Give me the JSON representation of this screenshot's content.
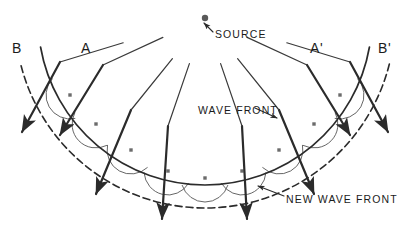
{
  "figure": {
    "ink_color": "#2b2b2b",
    "background_color": "#ffffff",
    "width": 409,
    "height": 228
  },
  "labels": {
    "source": "SOURCE",
    "ray_a_left": "A",
    "ray_b_left": "B",
    "ray_a_right": "A'",
    "ray_b_right": "B'",
    "wave_front": "WAVE FRONT",
    "new_wave_front": "NEW WAVE FRONT"
  },
  "source_point": {
    "x": 205,
    "y": 18,
    "radius": 3.2
  },
  "wave_front": {
    "kind": "solid-arc",
    "description": "original circular wave front centered on the source",
    "center": {
      "x": 205,
      "y": 18
    },
    "radius": 167,
    "start_angle_deg": 10,
    "end_angle_deg": 170
  },
  "new_wave_front": {
    "kind": "dashed-arc",
    "description": "envelope of the secondary wavelets",
    "center": {
      "x": 205,
      "y": 18
    },
    "radius": 190,
    "start_angle_deg": 14,
    "end_angle_deg": 166
  },
  "wavelet_points": [
    {
      "x": 70,
      "y": 95
    },
    {
      "x": 96,
      "y": 124
    },
    {
      "x": 131,
      "y": 150
    },
    {
      "x": 168,
      "y": 171
    },
    {
      "x": 205,
      "y": 178
    },
    {
      "x": 242,
      "y": 171
    },
    {
      "x": 279,
      "y": 150
    },
    {
      "x": 314,
      "y": 124
    },
    {
      "x": 340,
      "y": 95
    }
  ],
  "wavelet_radius": 24,
  "rays": [
    {
      "name": "ray-b-left",
      "label": "B",
      "label_x": 12,
      "label_y": 40,
      "from": {
        "x": 60,
        "y": 62
      },
      "to": {
        "x": 22,
        "y": 132
      }
    },
    {
      "name": "ray-a-left",
      "label": "A",
      "label_x": 81,
      "label_y": 40,
      "from": {
        "x": 103,
        "y": 65
      },
      "to": {
        "x": 60,
        "y": 135
      }
    },
    {
      "name": "ray-mid-left",
      "label": "",
      "from": {
        "x": 131,
        "y": 110
      },
      "to": {
        "x": 96,
        "y": 194
      }
    },
    {
      "name": "ray-inner-left",
      "label": "",
      "from": {
        "x": 168,
        "y": 126
      },
      "to": {
        "x": 162,
        "y": 219
      }
    },
    {
      "name": "ray-inner-right",
      "label": "",
      "from": {
        "x": 242,
        "y": 126
      },
      "to": {
        "x": 247,
        "y": 219
      }
    },
    {
      "name": "ray-mid-right",
      "label": "",
      "from": {
        "x": 279,
        "y": 110
      },
      "to": {
        "x": 314,
        "y": 194
      }
    },
    {
      "name": "ray-a-right",
      "label": "A'",
      "label_x": 310,
      "label_y": 40,
      "from": {
        "x": 307,
        "y": 65
      },
      "to": {
        "x": 350,
        "y": 135
      }
    },
    {
      "name": "ray-b-right",
      "label": "B'",
      "label_x": 378,
      "label_y": 40,
      "from": {
        "x": 350,
        "y": 62
      },
      "to": {
        "x": 388,
        "y": 132
      }
    }
  ],
  "annotations": {
    "source": {
      "text_x": 215,
      "text_y": 28,
      "arrow_from": {
        "x": 213,
        "y": 32
      },
      "arrow_to": {
        "x": 204,
        "y": 23
      }
    },
    "wave_front": {
      "text_x": 198,
      "text_y": 104,
      "arrow_from": {
        "x": 255,
        "y": 108
      },
      "arrow_to": {
        "x": 277,
        "y": 118
      }
    },
    "new_wave_front": {
      "text_x": 286,
      "text_y": 193,
      "arrow_from": {
        "x": 284,
        "y": 196
      },
      "arrow_to": {
        "x": 258,
        "y": 186
      }
    }
  }
}
